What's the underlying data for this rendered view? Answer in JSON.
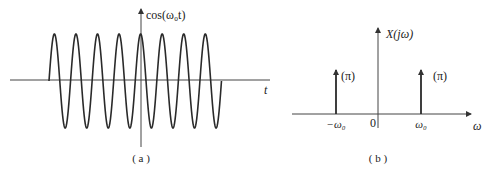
{
  "panel_a": {
    "caption": "( a )",
    "y_label": "cos(ω₀t)",
    "x_label": "t",
    "signal": {
      "type": "cosine",
      "periods_shown": 8,
      "start_x": 49,
      "period_px": 21.56,
      "center_y": 81,
      "amplitude_px": 47
    }
  },
  "panel_b": {
    "caption": "( b )",
    "y_label": "X(jω)",
    "x_label": "ω",
    "origin_label": "0",
    "impulses": [
      {
        "position_label": "−ω₀",
        "weight_label": "(π)"
      },
      {
        "position_label": "ω₀",
        "weight_label": "(π)"
      }
    ]
  },
  "colors": {
    "line": "#2a2a2a",
    "axis": "#444444",
    "background": "#ffffff"
  }
}
